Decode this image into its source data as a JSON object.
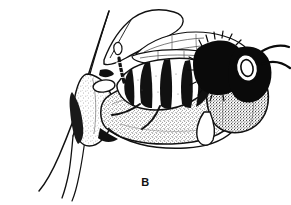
{
  "figure": {
    "label": "B",
    "caption_label": "B",
    "style": "black-and-white stipple and line illustration",
    "background_color": "#ffffff",
    "ink_color": "#000000",
    "stipple_color": "#555555",
    "parts": [
      {
        "name": "flower-petal-upper",
        "label": "upper petal"
      },
      {
        "name": "flower-petal-left-long",
        "label": "long left petal"
      },
      {
        "name": "flower-stem",
        "label": "stem"
      },
      {
        "name": "flower-petal-lower-left",
        "label": "lower left petal"
      },
      {
        "name": "flower-throat",
        "label": "stippled flower throat"
      },
      {
        "name": "flower-lip-right",
        "label": "right stippled lip"
      },
      {
        "name": "bee-wing-fore",
        "label": "forewing"
      },
      {
        "name": "bee-wing-hind",
        "label": "hindwing"
      },
      {
        "name": "bee-thorax",
        "label": "hairy black thorax"
      },
      {
        "name": "bee-abdomen",
        "label": "banded abdomen"
      },
      {
        "name": "bee-head",
        "label": "head"
      },
      {
        "name": "bee-eye",
        "label": "compound eye"
      },
      {
        "name": "bee-antenna-upper",
        "label": "upper antenna"
      },
      {
        "name": "bee-antenna-lower",
        "label": "lower antenna"
      },
      {
        "name": "bee-leg-front",
        "label": "front leg"
      },
      {
        "name": "bee-leg-mid",
        "label": "mid leg"
      }
    ]
  }
}
